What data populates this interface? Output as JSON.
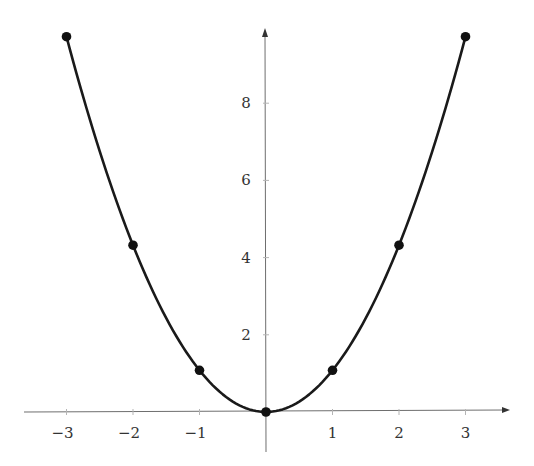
{
  "chart_data": {
    "type": "line",
    "title": "",
    "xlabel": "",
    "ylabel": "",
    "function": "y = x^2",
    "x": [
      -3,
      -2,
      -1,
      0,
      1,
      2,
      3
    ],
    "series": [
      {
        "name": "y = x^2",
        "values": [
          9,
          4,
          1,
          0,
          1,
          4,
          9
        ],
        "markers": true
      }
    ],
    "xlim": [
      -3.6,
      3.8
    ],
    "ylim": [
      -1,
      9.8
    ],
    "x_ticks": [
      -3,
      -2,
      -1,
      1,
      2,
      3
    ],
    "x_tick_labels": [
      "−3",
      "−2",
      "−1",
      "1",
      "2",
      "3"
    ],
    "y_ticks": [
      2,
      4,
      6,
      8
    ],
    "y_tick_labels": [
      "2",
      "4",
      "6",
      "8"
    ],
    "grid": false,
    "legend": null,
    "axes_style": "centered with arrowheads",
    "colors": {
      "curve": "#1a1a1a",
      "axis": "#6e6e6e",
      "text": "#333333"
    }
  }
}
